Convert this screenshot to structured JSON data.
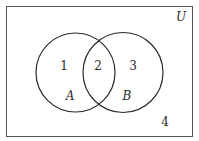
{
  "diagram": {
    "type": "venn",
    "universe_label": "U",
    "sets": [
      {
        "name": "A",
        "label": "A"
      },
      {
        "name": "B",
        "label": "B"
      }
    ],
    "regions": [
      {
        "id": "A-only",
        "label": "1"
      },
      {
        "id": "A-and-B",
        "label": "2"
      },
      {
        "id": "B-only",
        "label": "3"
      },
      {
        "id": "outside",
        "label": "4"
      }
    ],
    "colors": {
      "stroke": "#2a2a2a",
      "background": "#ffffff"
    }
  }
}
